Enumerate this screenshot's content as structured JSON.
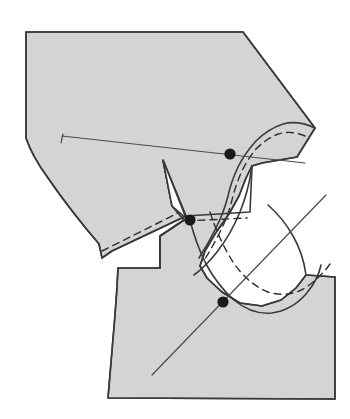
{
  "figure": {
    "kind": "technical-pattern-diagram",
    "canvas": {
      "width": 350,
      "height": 419
    },
    "colors": {
      "background": "#ffffff",
      "piece_fill": "#d4d4d4",
      "cut_line": "#3a3a3a",
      "seam_line": "#2f2f2f",
      "guide_line": "#4a4a4a",
      "match_point": "#1a1a1a"
    },
    "stroke_widths": {
      "cut_line": 1.6,
      "seam_line": 1.4,
      "guide_line": 1.2
    },
    "dash_pattern": "7,5"
  },
  "geometry": {
    "body_outline": "M 26,32 L 243,32 L 315,128 L 297,157 L 262,163 L 252,166 L 246,178 L 239,196 L 229,214 L 215,234 L 205,251 L 200,266 L 207,278 L 222,292 L 240,303 L 262,306 L 281,300 L 296,288 L 306,275 L 335,277 L 335,399 L 108,398 Q 112,350 115,315 Q 117,290 118,268 L 160,268 L 160,236 L 184,220 L 172,206 L 163,160 L 186,216 L 112,251 L 102,258 L 99,244 Q 70,210 48,178 Q 32,156 26,138 Z",
    "upper_strip_cut": "M 315,128 Q 298,120 283,124 Q 268,129 256,141 Q 245,153 238,167 Q 231,182 228,196 Q 224,212 216,228 Q 208,244 199,258",
    "upper_strip_seam": "M 305,136 Q 291,130 278,134 Q 266,139 256,149 Q 247,160 241,173 Q 235,187 232,200 Q 228,216 220,232 Q 212,248 203,262",
    "armhole_cut": "M 252,166 L 251,172 Q 248,192 240,212 Q 231,234 217,252 Q 206,266 194,275",
    "armhole_cut2": "M 306,275 Q 303,253 293,236 Q 283,218 268,205",
    "lower_curve_cut": "M 190,220 Q 196,244 206,264 Q 218,286 234,300 Q 252,315 272,313 Q 292,310 306,294 Q 318,280 321,265",
    "lower_curve_seam": "M 210,212 Q 219,240 233,262 Q 248,284 268,292 Q 288,298 305,288 Q 320,278 330,264",
    "left_panel_seam": "M 102,251 Q 130,237 158,223 Q 172,216 186,209",
    "left_panel_cut_bottom": "M 99,258 L 113,252",
    "dart_notch": "M 163,160 L 186,218 L 172,206 Z",
    "sleeve_inner_seam": "M 186,216 L 250,212 L 252,166",
    "sleeve_inner_seam2": "M 186,221 L 247,218",
    "notch_box": "M 160,268 L 160,236 L 184,220",
    "guide_line_upper": {
      "x1": 62,
      "y1": 136,
      "x2": 305,
      "y2": 163
    },
    "guide_line_lower": {
      "x1": 152,
      "y1": 375,
      "x2": 326,
      "y2": 195
    },
    "guide_tick_upper": {
      "x1": 63,
      "y1": 134,
      "x2": 61,
      "y2": 143
    },
    "match_points": [
      {
        "name": "shoulder-match-point",
        "cx": 230,
        "cy": 154,
        "r": 5.6
      },
      {
        "name": "underarm-match-point",
        "cx": 190,
        "cy": 220,
        "r": 5.6
      },
      {
        "name": "side-seam-match-point",
        "cx": 223,
        "cy": 302,
        "r": 5.6
      }
    ]
  }
}
